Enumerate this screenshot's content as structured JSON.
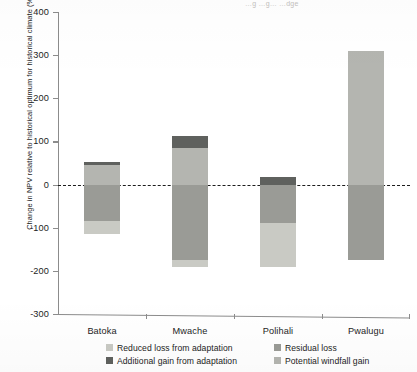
{
  "header": {
    "cutoff_text": "…g …g… …dge"
  },
  "axis": {
    "y_title": "Change in NPV relative to historical optimum for historical climate (%)",
    "y_ticks": [
      400,
      300,
      200,
      100,
      0,
      -100,
      -200,
      -300
    ],
    "y_tick_labels": [
      "400",
      "300",
      "200",
      "100",
      "0",
      "-100",
      "-200",
      "-300"
    ],
    "x_labels": [
      "Batoka",
      "Mwache",
      "Polihali",
      "Pwalugu"
    ]
  },
  "legend": {
    "items": [
      {
        "label": "Reduced loss from adaptation",
        "color": "#c9cac4"
      },
      {
        "label": "Residual loss",
        "color": "#9a9b96"
      },
      {
        "label": "Additional gain from adaptation",
        "color": "#5f615e"
      },
      {
        "label": "Potential windfall gain",
        "color": "#b4b5b0"
      }
    ]
  },
  "colors": {
    "reduced_loss": "#c9cac4",
    "residual_loss": "#9a9b96",
    "additional_gain": "#5f615e",
    "windfall_gain": "#b4b5b0",
    "axis": "#8c8c8c",
    "text": "#1d1d1d"
  },
  "chart_data": {
    "type": "bar",
    "title": "",
    "subtitle": "",
    "xlabel": "",
    "ylabel": "Change in NPV relative to historical optimum for historical climate (%)",
    "ylim": [
      -300,
      400
    ],
    "ytick_step": 100,
    "grid": false,
    "zero_line": true,
    "zero_line_style": "dashed",
    "legend_position": "below-axis",
    "stacked": true,
    "categories": [
      "Batoka",
      "Mwache",
      "Polihali",
      "Pwalugu"
    ],
    "series": [
      {
        "name": "Reduced loss from adaptation",
        "color": "#c9cac4",
        "values": [
          -30,
          -17,
          -104,
          0
        ]
      },
      {
        "name": "Residual loss",
        "color": "#9a9b96",
        "values": [
          -85,
          -175,
          -88,
          -175
        ]
      },
      {
        "name": "Additional gain from adaptation",
        "color": "#5f615e",
        "values": [
          6,
          27,
          17,
          0
        ]
      },
      {
        "name": "Potential windfall gain",
        "color": "#b4b5b0",
        "values": [
          46,
          85,
          0,
          310
        ]
      }
    ],
    "bars": [
      {
        "category": "Batoka",
        "segments": [
          {
            "series": "Additional gain from adaptation",
            "from": 46,
            "to": 52,
            "color": "#5f615e"
          },
          {
            "series": "Potential windfall gain",
            "from": 0,
            "to": 46,
            "color": "#b4b5b0"
          },
          {
            "series": "Residual loss",
            "from": 0,
            "to": -85,
            "color": "#9a9b96"
          },
          {
            "series": "Reduced loss from adaptation",
            "from": -85,
            "to": -115,
            "color": "#c9cac4"
          }
        ]
      },
      {
        "category": "Mwache",
        "segments": [
          {
            "series": "Additional gain from adaptation",
            "from": 85,
            "to": 112,
            "color": "#5f615e"
          },
          {
            "series": "Potential windfall gain",
            "from": 0,
            "to": 85,
            "color": "#b4b5b0"
          },
          {
            "series": "Residual loss",
            "from": 0,
            "to": -175,
            "color": "#9a9b96"
          },
          {
            "series": "Reduced loss from adaptation",
            "from": -175,
            "to": -192,
            "color": "#c9cac4"
          }
        ]
      },
      {
        "category": "Polihali",
        "segments": [
          {
            "series": "Additional gain from adaptation",
            "from": 0,
            "to": 17,
            "color": "#5f615e"
          },
          {
            "series": "Residual loss",
            "from": 0,
            "to": -88,
            "color": "#9a9b96"
          },
          {
            "series": "Reduced loss from adaptation",
            "from": -88,
            "to": -192,
            "color": "#c9cac4"
          }
        ]
      },
      {
        "category": "Pwalugu",
        "segments": [
          {
            "series": "Potential windfall gain",
            "from": 0,
            "to": 310,
            "color": "#b4b5b0"
          },
          {
            "series": "Residual loss",
            "from": 0,
            "to": -175,
            "color": "#9a9b96"
          }
        ]
      }
    ]
  }
}
